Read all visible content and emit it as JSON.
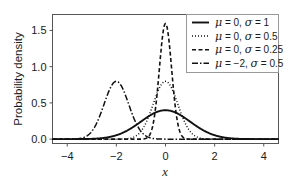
{
  "chart_data": {
    "type": "line",
    "title": "",
    "subtitle": "",
    "xlabel": "x",
    "ylabel": "Probability density",
    "xlim": [
      -4.6,
      4.6
    ],
    "ylim": [
      -0.06,
      1.72
    ],
    "xticks": [
      "-4",
      "-2",
      "0",
      "2",
      "4"
    ],
    "xtick_values": [
      -4,
      -2,
      0,
      2,
      4
    ],
    "yticks": [
      "0.0",
      "0.5",
      "1.0",
      "1.5"
    ],
    "ytick_values": [
      0.0,
      0.5,
      1.0,
      1.5
    ],
    "grid": false,
    "legend_position": "upper right",
    "frame": true,
    "line_color": "#111111",
    "background": "#ffffff",
    "series": [
      {
        "name": "μ = 0, σ = 1",
        "mu": 0,
        "sigma": 1,
        "linestyle": "solid",
        "peak": 0.399,
        "peak_x": 0
      },
      {
        "name": "μ = 0, σ = 0.5",
        "mu": 0,
        "sigma": 0.5,
        "linestyle": "dotted",
        "peak": 0.798,
        "peak_x": 0
      },
      {
        "name": "μ = 0, σ = 0.25",
        "mu": 0,
        "sigma": 0.25,
        "linestyle": "dashed",
        "peak": 1.596,
        "peak_x": 0
      },
      {
        "name": "μ = −2, σ = 0.5",
        "mu": -2,
        "sigma": 0.5,
        "linestyle": "dashdot",
        "peak": 0.798,
        "peak_x": -2
      }
    ]
  },
  "legend": {
    "entries": [
      {
        "label": "μ = 0, σ = 1"
      },
      {
        "label": "μ = 0, σ = 0.5"
      },
      {
        "label": "μ = 0, σ = 0.25"
      },
      {
        "label": "μ = −2, σ = 0.5"
      }
    ]
  }
}
